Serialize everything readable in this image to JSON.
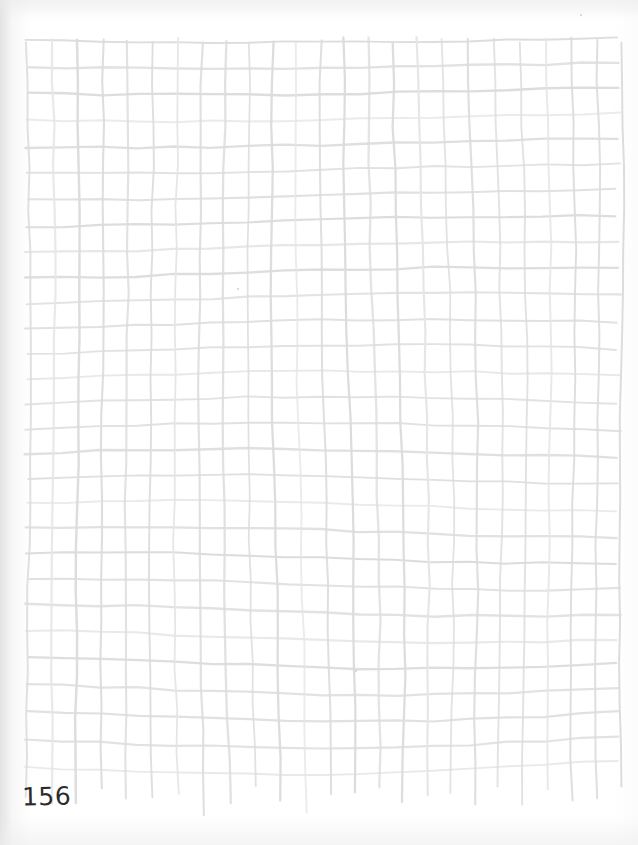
{
  "page": {
    "width": 638,
    "height": 845,
    "background_color": "#ffffff",
    "media_type": "scanned-paper"
  },
  "annotations": {
    "page_number": "156",
    "page_number_color": "#2b2b2b",
    "page_number_position": {
      "x": 22,
      "y": 784
    }
  },
  "grid": {
    "line_color": "#dcdcdc",
    "line_color_faint": "#e6e6e6",
    "line_width": 2.1,
    "columns": 24,
    "rows": 28,
    "origin": {
      "x": 27,
      "y": 40
    },
    "extent": {
      "x": 618,
      "y": 768
    },
    "col_spacing": 25.5,
    "row_spacing": 26.2,
    "style": "hand-drawn-wobbly",
    "note": "vertical strokes overrun the lowest horizontal line with ragged ends"
  },
  "marks": [
    {
      "name": "speck-upper",
      "x": 237,
      "y": 288,
      "size": 2
    },
    {
      "name": "speck-lower",
      "x": 355,
      "y": 670,
      "size": 2
    },
    {
      "name": "speck-corner",
      "x": 580,
      "y": 14,
      "size": 2
    }
  ]
}
